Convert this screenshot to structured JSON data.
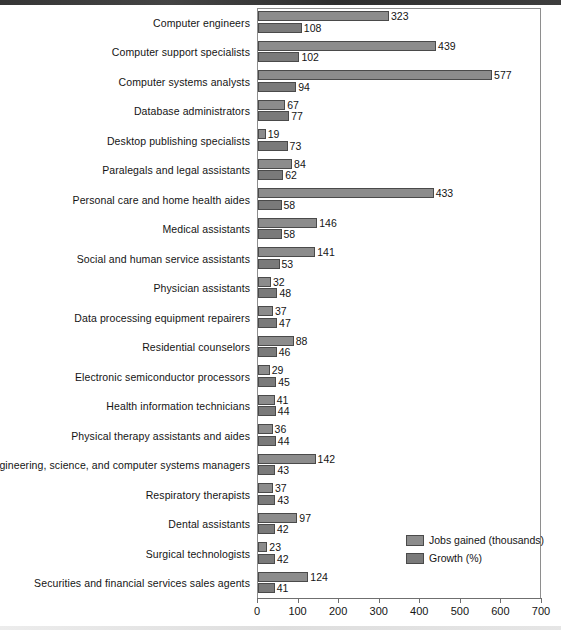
{
  "chart_data": {
    "type": "bar",
    "orientation": "horizontal",
    "title": "",
    "xlabel": "",
    "ylabel": "",
    "xlim": [
      0,
      700
    ],
    "xticks": [
      0,
      100,
      200,
      300,
      400,
      500,
      600,
      700
    ],
    "grid": false,
    "legend_position": "bottom-right",
    "categories": [
      "Computer engineers",
      "Computer support specialists",
      "Computer systems analysts",
      "Database administrators",
      "Desktop publishing specialists",
      "Paralegals and legal assistants",
      "Personal care and home health aides",
      "Medical assistants",
      "Social and human service assistants",
      "Physician assistants",
      "Data processing equipment repairers",
      "Residential counselors",
      "Electronic semiconductor processors",
      "Health information technicians",
      "Physical therapy assistants and aides",
      "Engineering, science, and computer systems managers",
      "Respiratory therapists",
      "Dental assistants",
      "Surgical technologists",
      "Securities and financial services sales agents"
    ],
    "series": [
      {
        "name": "Jobs gained (thousands)",
        "color": "#8c8c8c",
        "values": [
          323,
          439,
          577,
          67,
          19,
          84,
          433,
          146,
          141,
          32,
          37,
          88,
          29,
          41,
          36,
          142,
          37,
          97,
          23,
          124
        ]
      },
      {
        "name": "Growth (%)",
        "color": "#7a7a7a",
        "values": [
          108,
          102,
          94,
          77,
          73,
          62,
          58,
          58,
          53,
          48,
          47,
          46,
          45,
          44,
          44,
          43,
          43,
          42,
          42,
          41
        ]
      }
    ]
  },
  "legend": {
    "items": [
      {
        "label": "Jobs gained (thousands)",
        "swatch": "jobs"
      },
      {
        "label": "Growth (%)",
        "swatch": "growth"
      }
    ]
  }
}
